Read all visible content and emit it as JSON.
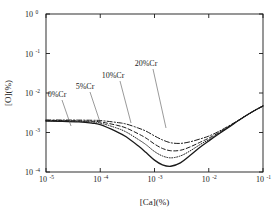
{
  "chart_data": {
    "type": "line",
    "title": "",
    "xlabel": "[Ca](%)",
    "ylabel": "[O](%)",
    "xscale": "log",
    "yscale": "log",
    "xlim": [
      1e-05,
      0.1
    ],
    "ylim": [
      0.0001,
      1.0
    ],
    "grid": false,
    "legend_position": "inline-annotations",
    "xticks": [
      {
        "value": 1e-05,
        "mantissa": "10",
        "exponent": "-5"
      },
      {
        "value": 0.0001,
        "mantissa": "10",
        "exponent": "-4"
      },
      {
        "value": 0.001,
        "mantissa": "10",
        "exponent": "-3"
      },
      {
        "value": 0.01,
        "mantissa": "10",
        "exponent": "-2"
      },
      {
        "value": 0.1,
        "mantissa": "10",
        "exponent": "-1"
      }
    ],
    "yticks": [
      {
        "value": 1.0,
        "mantissa": "10",
        "exponent": "0"
      },
      {
        "value": 0.1,
        "mantissa": "10",
        "exponent": "-1"
      },
      {
        "value": 0.01,
        "mantissa": "10",
        "exponent": "-2"
      },
      {
        "value": 0.001,
        "mantissa": "10",
        "exponent": "-3"
      },
      {
        "value": 0.0001,
        "mantissa": "10",
        "exponent": "-4"
      }
    ],
    "series": [
      {
        "name": "0%Cr",
        "label": "0%Cr",
        "style": "solid",
        "color": "#1a1a1a",
        "width": 1.3,
        "x": [
          1e-05,
          2e-05,
          4e-05,
          7e-05,
          0.0001,
          0.0002,
          0.0003,
          0.0005,
          0.0007,
          0.001,
          0.0014,
          0.002,
          0.003,
          0.0045,
          0.007,
          0.01,
          0.015,
          0.025,
          0.045,
          0.07,
          0.1
        ],
        "y": [
          0.00195,
          0.00192,
          0.00185,
          0.00172,
          0.00158,
          0.00105,
          0.00078,
          0.00046,
          0.00031,
          0.0002,
          0.000152,
          0.00014,
          0.00017,
          0.00026,
          0.00043,
          0.00061,
          0.0009,
          0.00145,
          0.0025,
          0.0036,
          0.0047
        ]
      },
      {
        "name": "5%Cr",
        "label": "5%Cr",
        "style": "dotted",
        "color": "#1a1a1a",
        "width": 1.0,
        "x": [
          1e-05,
          2e-05,
          4e-05,
          7e-05,
          0.0001,
          0.0002,
          0.0003,
          0.0005,
          0.0007,
          0.001,
          0.0014,
          0.002,
          0.003,
          0.0045,
          0.007,
          0.01,
          0.015,
          0.025,
          0.045,
          0.07,
          0.1
        ],
        "y": [
          0.00198,
          0.00196,
          0.00192,
          0.00184,
          0.00174,
          0.0013,
          0.00103,
          0.00067,
          0.00049,
          0.00033,
          0.000255,
          0.000228,
          0.000255,
          0.00034,
          0.0005,
          0.00066,
          0.00093,
          0.00147,
          0.0025,
          0.0036,
          0.0047
        ]
      },
      {
        "name": "10%Cr",
        "label": "10%Cr",
        "style": "dashed",
        "color": "#1a1a1a",
        "width": 1.0,
        "x": [
          1e-05,
          2e-05,
          4e-05,
          7e-05,
          0.0001,
          0.0002,
          0.0003,
          0.0005,
          0.0007,
          0.001,
          0.0014,
          0.002,
          0.003,
          0.0045,
          0.007,
          0.01,
          0.015,
          0.025,
          0.045,
          0.07,
          0.1
        ],
        "y": [
          0.00202,
          0.002,
          0.00197,
          0.00192,
          0.00186,
          0.00153,
          0.0013,
          0.00093,
          0.00072,
          0.00051,
          0.000395,
          0.000345,
          0.000355,
          0.00043,
          0.00057,
          0.00072,
          0.00098,
          0.0015,
          0.0025,
          0.0036,
          0.0047
        ]
      },
      {
        "name": "20%Cr",
        "label": "20%Cr",
        "style": "dashdot",
        "color": "#1a1a1a",
        "width": 1.0,
        "x": [
          1e-05,
          2e-05,
          4e-05,
          7e-05,
          0.0001,
          0.0002,
          0.0003,
          0.0005,
          0.0007,
          0.001,
          0.0014,
          0.002,
          0.003,
          0.0045,
          0.007,
          0.01,
          0.015,
          0.025,
          0.045,
          0.07,
          0.1
        ],
        "y": [
          0.00208,
          0.00207,
          0.00206,
          0.00204,
          0.00201,
          0.0018,
          0.00164,
          0.0013,
          0.00108,
          0.00082,
          0.00065,
          0.00055,
          0.00053,
          0.00058,
          0.00069,
          0.00081,
          0.00105,
          0.00155,
          0.0025,
          0.0036,
          0.0047
        ]
      }
    ],
    "annotations": [
      {
        "text": "0%Cr",
        "label_x": 57,
        "label_y": 97,
        "leader": [
          [
            62,
            100
          ],
          [
            71,
            126
          ]
        ]
      },
      {
        "text": "5%Cr",
        "label_x": 85,
        "label_y": 89,
        "leader": [
          [
            90,
            92
          ],
          [
            101,
            125
          ]
        ]
      },
      {
        "text": "10%Cr",
        "label_x": 113,
        "label_y": 78,
        "leader": [
          [
            120,
            81
          ],
          [
            131,
            123
          ]
        ]
      },
      {
        "text": "20%Cr",
        "label_x": 146,
        "label_y": 66,
        "leader": [
          [
            153,
            69
          ],
          [
            166,
            128
          ]
        ]
      }
    ],
    "frame": {
      "left": 46,
      "right": 263,
      "top": 14,
      "bottom": 172,
      "color": "#1a1a1a"
    }
  }
}
